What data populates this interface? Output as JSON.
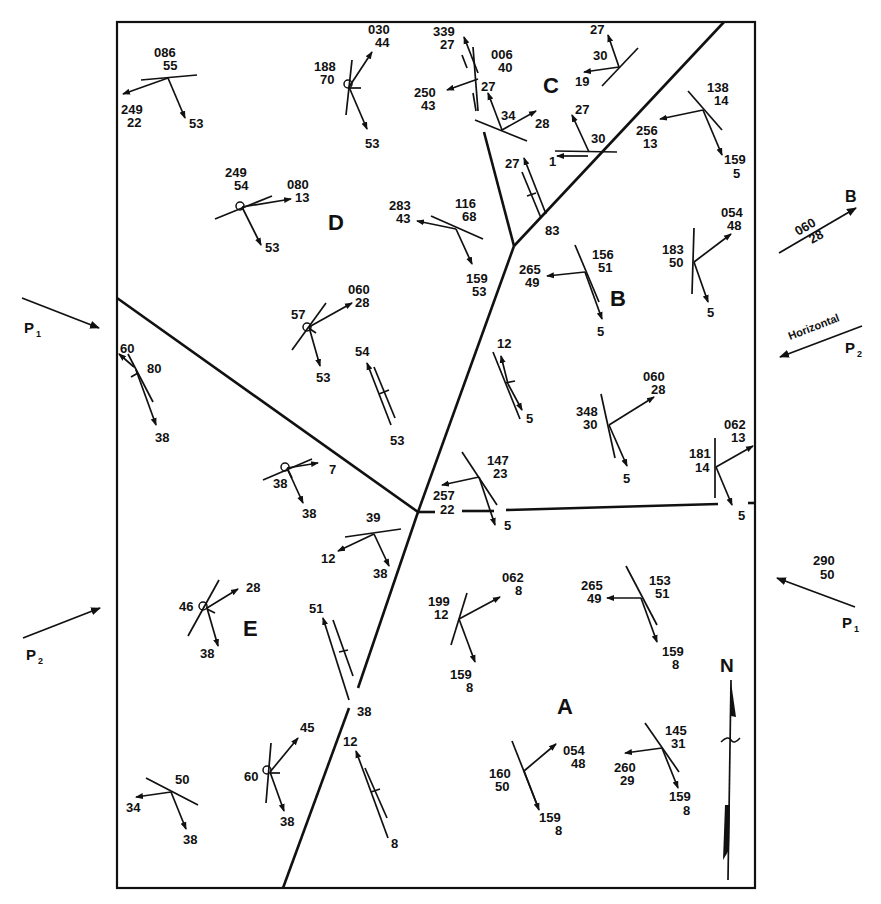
{
  "figure": {
    "type": "structural geology map — fault blocks with plane/lineation orientation symbols",
    "regions": [
      {
        "id": "A",
        "label": "A"
      },
      {
        "id": "B",
        "label": "B"
      },
      {
        "id": "C",
        "label": "C"
      },
      {
        "id": "D",
        "label": "D"
      },
      {
        "id": "E",
        "label": "E"
      }
    ],
    "north_arrow": {
      "label": "N"
    },
    "external_arrows": [
      {
        "id": "P1-left",
        "label": "P",
        "sub": "1",
        "direction": "pointing into map from west"
      },
      {
        "id": "P2-left",
        "label": "P",
        "sub": "2",
        "direction": "pointing into map from west"
      },
      {
        "id": "B-right",
        "label": "B",
        "trend": "060",
        "plunge": "28"
      },
      {
        "id": "P2-right",
        "label": "P",
        "sub": "2",
        "note": "Horizontal"
      },
      {
        "id": "P1-right",
        "label": "P",
        "sub": "1",
        "trend": "290",
        "plunge": "50"
      }
    ],
    "annotations": {
      "region_D": [
        {
          "values": [
            "086",
            "55"
          ]
        },
        {
          "values": [
            "249",
            "22"
          ]
        },
        {
          "values": [
            "53"
          ]
        },
        {
          "values": [
            "030",
            "44"
          ]
        },
        {
          "values": [
            "188",
            "70"
          ]
        },
        {
          "values": [
            "53"
          ]
        },
        {
          "values": [
            "249",
            "54"
          ]
        },
        {
          "values": [
            "080",
            "13"
          ]
        },
        {
          "values": [
            "53"
          ]
        },
        {
          "values": [
            "283",
            "43"
          ]
        },
        {
          "values": [
            "116",
            "68"
          ]
        },
        {
          "values": [
            "159",
            "53"
          ]
        },
        {
          "values": [
            "060",
            "28"
          ]
        },
        {
          "values": [
            "57"
          ]
        },
        {
          "values": [
            "53"
          ]
        },
        {
          "values": [
            "54"
          ]
        },
        {
          "values": [
            "53"
          ]
        }
      ],
      "region_C": [
        {
          "values": [
            "339",
            "27"
          ]
        },
        {
          "values": [
            "006",
            "40"
          ]
        },
        {
          "values": [
            "250",
            "43"
          ]
        },
        {
          "values": [
            "27"
          ]
        },
        {
          "values": [
            "34"
          ]
        },
        {
          "values": [
            "28"
          ]
        },
        {
          "values": [
            "27"
          ]
        },
        {
          "values": [
            "30"
          ]
        },
        {
          "values": [
            "19"
          ]
        },
        {
          "values": [
            "27"
          ]
        },
        {
          "values": [
            "30"
          ]
        },
        {
          "values": [
            "1"
          ]
        },
        {
          "values": [
            "27"
          ]
        },
        {
          "values": [
            "83"
          ]
        }
      ],
      "region_B": [
        {
          "values": [
            "138",
            "14"
          ]
        },
        {
          "values": [
            "256",
            "13"
          ]
        },
        {
          "values": [
            "159",
            "5"
          ]
        },
        {
          "values": [
            "156",
            "51"
          ]
        },
        {
          "values": [
            "265",
            "49"
          ]
        },
        {
          "values": [
            "5"
          ]
        },
        {
          "values": [
            "054",
            "48"
          ]
        },
        {
          "values": [
            "183",
            "50"
          ]
        },
        {
          "values": [
            "5"
          ]
        },
        {
          "values": [
            "12"
          ]
        },
        {
          "values": [
            "5"
          ]
        },
        {
          "values": [
            "060",
            "28"
          ]
        },
        {
          "values": [
            "348",
            "30"
          ]
        },
        {
          "values": [
            "5"
          ]
        },
        {
          "values": [
            "062",
            "13"
          ]
        },
        {
          "values": [
            "181",
            "14"
          ]
        },
        {
          "values": [
            "5"
          ]
        },
        {
          "values": [
            "147",
            "23"
          ]
        },
        {
          "values": [
            "257",
            "22"
          ]
        },
        {
          "values": [
            "5"
          ]
        }
      ],
      "region_E": [
        {
          "values": [
            "60"
          ]
        },
        {
          "values": [
            "80"
          ]
        },
        {
          "values": [
            "38"
          ]
        },
        {
          "values": [
            "38"
          ]
        },
        {
          "values": [
            "7"
          ]
        },
        {
          "values": [
            "38"
          ]
        },
        {
          "values": [
            "39"
          ]
        },
        {
          "values": [
            "12"
          ]
        },
        {
          "values": [
            "38"
          ]
        },
        {
          "values": [
            "46"
          ]
        },
        {
          "values": [
            "28"
          ]
        },
        {
          "values": [
            "38"
          ]
        },
        {
          "values": [
            "51"
          ]
        },
        {
          "values": [
            "38"
          ]
        },
        {
          "values": [
            "50"
          ]
        },
        {
          "values": [
            "34"
          ]
        },
        {
          "values": [
            "38"
          ]
        },
        {
          "values": [
            "45"
          ]
        },
        {
          "values": [
            "60"
          ]
        },
        {
          "values": [
            "38"
          ]
        }
      ],
      "region_A": [
        {
          "values": [
            "062",
            "8"
          ]
        },
        {
          "values": [
            "199",
            "12"
          ]
        },
        {
          "values": [
            "159",
            "8"
          ]
        },
        {
          "values": [
            "153",
            "51"
          ]
        },
        {
          "values": [
            "265",
            "49"
          ]
        },
        {
          "values": [
            "159",
            "8"
          ]
        },
        {
          "values": [
            "054",
            "48"
          ]
        },
        {
          "values": [
            "160",
            "50"
          ]
        },
        {
          "values": [
            "159",
            "8"
          ]
        },
        {
          "values": [
            "145",
            "31"
          ]
        },
        {
          "values": [
            "260",
            "29"
          ]
        },
        {
          "values": [
            "159",
            "8"
          ]
        },
        {
          "values": [
            "12"
          ]
        },
        {
          "values": [
            "8"
          ]
        }
      ]
    },
    "side_labels": {
      "horizontal": "Horizontal"
    }
  },
  "labels": {
    "A": "A",
    "B": "B",
    "C": "C",
    "D": "D",
    "E": "E",
    "N": "N",
    "P": "P",
    "sub1": "1",
    "sub2": "2",
    "Bext": "B",
    "t060": "060",
    "t28": "28",
    "horizontal": "Horizontal",
    "t290": "290",
    "t50": "50",
    "d_086": "086",
    "d_55": "55",
    "d_249": "249",
    "d_22": "22",
    "d_53a": "53",
    "d_030": "030",
    "d_44": "44",
    "d_188": "188",
    "d_70": "70",
    "d_53b": "53",
    "d_249b": "249",
    "d_54": "54",
    "d_080": "080",
    "d_13": "13",
    "d_53c": "53",
    "d_283": "283",
    "d_43": "43",
    "d_116": "116",
    "d_68": "68",
    "d_159": "159",
    "d_53d": "53",
    "d_060": "060",
    "d_28": "28",
    "d_57": "57",
    "d_53e": "53",
    "d_54b": "54",
    "d_53f": "53",
    "c_339": "339",
    "c_27a": "27",
    "c_006": "006",
    "c_40": "40",
    "c_250": "250",
    "c_43": "43",
    "c_27b": "27",
    "c_34": "34",
    "c_28": "28",
    "c_27c": "27",
    "c_30a": "30",
    "c_19": "19",
    "c_27d": "27",
    "c_30b": "30",
    "c_1": "1",
    "c_27e": "27",
    "c_83": "83",
    "b_138": "138",
    "b_14": "14",
    "b_256": "256",
    "b_13": "13",
    "b_159": "159",
    "b_5a": "5",
    "b_156": "156",
    "b_51": "51",
    "b_265": "265",
    "b_49": "49",
    "b_5b": "5",
    "b_054": "054",
    "b_48": "48",
    "b_183": "183",
    "b_50": "50",
    "b_5c": "5",
    "b_12": "12",
    "b_5d": "5",
    "b_060": "060",
    "b_28": "28",
    "b_348": "348",
    "b_30": "30",
    "b_5e": "5",
    "b_062": "062",
    "b_13b": "13",
    "b_181": "181",
    "b_14b": "14",
    "b_5f": "5",
    "b_147": "147",
    "b_23": "23",
    "b_257": "257",
    "b_22": "22",
    "b_5g": "5",
    "e_60": "60",
    "e_80": "80",
    "e_38a": "38",
    "e_38b": "38",
    "e_7": "7",
    "e_38c": "38",
    "e_39": "39",
    "e_12": "12",
    "e_38d": "38",
    "e_46": "46",
    "e_28": "28",
    "e_38e": "38",
    "e_51": "51",
    "e_38f": "38",
    "e_50": "50",
    "e_34": "34",
    "e_38g": "38",
    "e_45": "45",
    "e_60b": "60",
    "e_38h": "38",
    "a_062": "062",
    "a_8a": "8",
    "a_199": "199",
    "a_12": "12",
    "a_159a": "159",
    "a_8b": "8",
    "a_153": "153",
    "a_51": "51",
    "a_265": "265",
    "a_49": "49",
    "a_159b": "159",
    "a_8c": "8",
    "a_054": "054",
    "a_48": "48",
    "a_160": "160",
    "a_50": "50",
    "a_159c": "159",
    "a_8d": "8",
    "a_145": "145",
    "a_31": "31",
    "a_260": "260",
    "a_29": "29",
    "a_159d": "159",
    "a_8e": "8",
    "a_12b": "12",
    "a_8f": "8"
  }
}
